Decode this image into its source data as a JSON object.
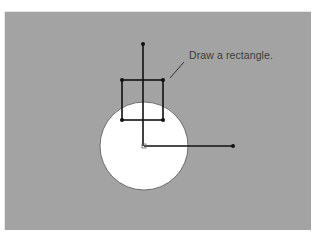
{
  "figure": {
    "annotation": "Draw a rectangle.",
    "colors": {
      "background": "#a3a3a3",
      "circle_fill": "#ffffff",
      "stroke": "#111111",
      "label": "#3c3c3c"
    },
    "circle": {
      "cx": 144,
      "cy": 146,
      "r": 44
    },
    "rectangle": {
      "corners": [
        {
          "x": 122,
          "y": 80
        },
        {
          "x": 163,
          "y": 80
        },
        {
          "x": 163,
          "y": 120
        },
        {
          "x": 122,
          "y": 120
        }
      ]
    },
    "vertical_axis": {
      "x": 143,
      "y1": 44,
      "y2": 146
    },
    "horizontal_axis": {
      "y": 146,
      "x1": 144,
      "x2": 233
    },
    "leader_line": {
      "x1": 184,
      "y1": 62,
      "x2": 170,
      "y2": 78
    }
  }
}
